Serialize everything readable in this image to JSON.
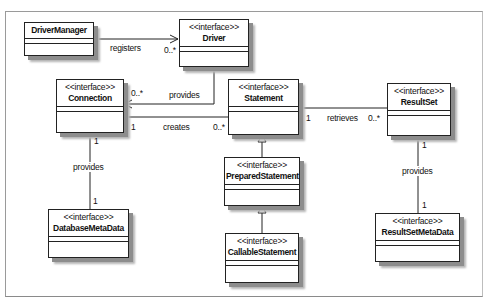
{
  "diagram": {
    "type": "UML class diagram",
    "stereotype_label": "<<interface>>",
    "classes": [
      {
        "id": "driver_manager",
        "name": "DriverManager",
        "stereotype": ""
      },
      {
        "id": "driver",
        "name": "Driver",
        "stereotype": "<<interface>>"
      },
      {
        "id": "connection",
        "name": "Connection",
        "stereotype": "<<interface>>"
      },
      {
        "id": "statement",
        "name": "Statement",
        "stereotype": "<<interface>>"
      },
      {
        "id": "result_set",
        "name": "ResultSet",
        "stereotype": "<<interface>>"
      },
      {
        "id": "prepared_statement",
        "name": "PreparedStatement",
        "stereotype": "<<interface>>"
      },
      {
        "id": "callable_statement",
        "name": "CallableStatement",
        "stereotype": "<<interface>>"
      },
      {
        "id": "database_meta_data",
        "name": "DatabaseMetaData",
        "stereotype": "<<interface>>"
      },
      {
        "id": "result_set_meta_data",
        "name": "ResultSetMetaData",
        "stereotype": "<<interface>>"
      }
    ],
    "relationships": [
      {
        "from": "DriverManager",
        "to": "Driver",
        "label": "registers",
        "target_multiplicity": "0..*",
        "kind": "association"
      },
      {
        "from": "Driver",
        "to": "Connection",
        "label": "provides",
        "target_multiplicity": "0..*",
        "kind": "association"
      },
      {
        "from": "Connection",
        "to": "Statement",
        "label": "creates",
        "source_multiplicity": "1",
        "target_multiplicity": "0..*",
        "kind": "association"
      },
      {
        "from": "Statement",
        "to": "ResultSet",
        "label": "retrieves",
        "source_multiplicity": "1",
        "target_multiplicity": "0..*",
        "kind": "association"
      },
      {
        "from": "Connection",
        "to": "DatabaseMetaData",
        "label": "provides",
        "source_multiplicity": "1",
        "target_multiplicity": "1",
        "kind": "association"
      },
      {
        "from": "ResultSet",
        "to": "ResultSetMetaData",
        "label": "provides",
        "source_multiplicity": "1",
        "target_multiplicity": "1",
        "kind": "association"
      },
      {
        "from": "PreparedStatement",
        "to": "Statement",
        "label": "",
        "kind": "generalization"
      },
      {
        "from": "CallableStatement",
        "to": "PreparedStatement",
        "label": "",
        "kind": "generalization"
      }
    ],
    "labels": {
      "registers": "registers",
      "registers_mult": "0..*",
      "driver_provides": "provides",
      "driver_provides_mult": "0..*",
      "creates": "creates",
      "creates_src_mult": "1",
      "creates_tgt_mult": "0..*",
      "retrieves": "retrieves",
      "retrieves_src_mult": "1",
      "retrieves_tgt_mult": "0..*",
      "conn_provides": "provides",
      "conn_provides_src_mult": "1",
      "conn_provides_tgt_mult": "1",
      "rs_provides": "provides",
      "rs_provides_src_mult": "1",
      "rs_provides_tgt_mult": "1"
    }
  }
}
